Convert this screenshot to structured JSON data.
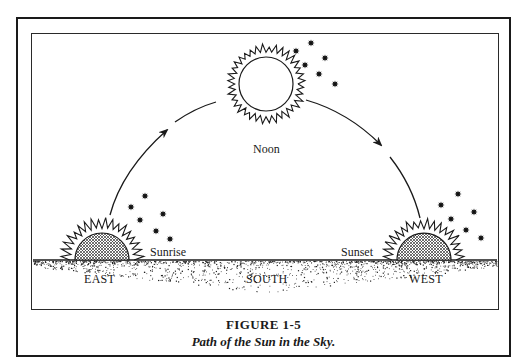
{
  "figure": {
    "number": "FIGURE 1-5",
    "title": "Path of the Sun in the Sky."
  },
  "labels": {
    "noon": "Noon",
    "sunrise": "Sunrise",
    "sunset": "Sunset",
    "east": "EAST",
    "south": "SOUTH",
    "west": "WEST"
  },
  "colors": {
    "ink": "#1a1a1a",
    "background": "#ffffff",
    "sun_fill_pattern": "crosshatch"
  },
  "suns": [
    {
      "id": "sunrise-sun",
      "position": "east",
      "cx": 102,
      "cy": 260,
      "shape": "half-disc",
      "fill": "crosshatch"
    },
    {
      "id": "noon-sun",
      "position": "overhead",
      "cx": 266,
      "cy": 84,
      "shape": "circle",
      "fill": "none"
    },
    {
      "id": "sunset-sun",
      "position": "west",
      "cx": 424,
      "cy": 260,
      "shape": "half-disc",
      "fill": "crosshatch"
    }
  ],
  "stars": {
    "east": [
      [
        145,
        196
      ],
      [
        131,
        207
      ],
      [
        163,
        214
      ],
      [
        140,
        220
      ],
      [
        156,
        231
      ],
      [
        170,
        239
      ]
    ],
    "noon": [
      [
        311,
        43
      ],
      [
        296,
        51
      ],
      [
        325,
        58
      ],
      [
        305,
        65
      ],
      [
        319,
        74
      ],
      [
        335,
        84
      ]
    ],
    "west": [
      [
        458,
        194
      ],
      [
        441,
        205
      ],
      [
        474,
        212
      ],
      [
        451,
        219
      ],
      [
        466,
        230
      ],
      [
        481,
        238
      ]
    ]
  }
}
